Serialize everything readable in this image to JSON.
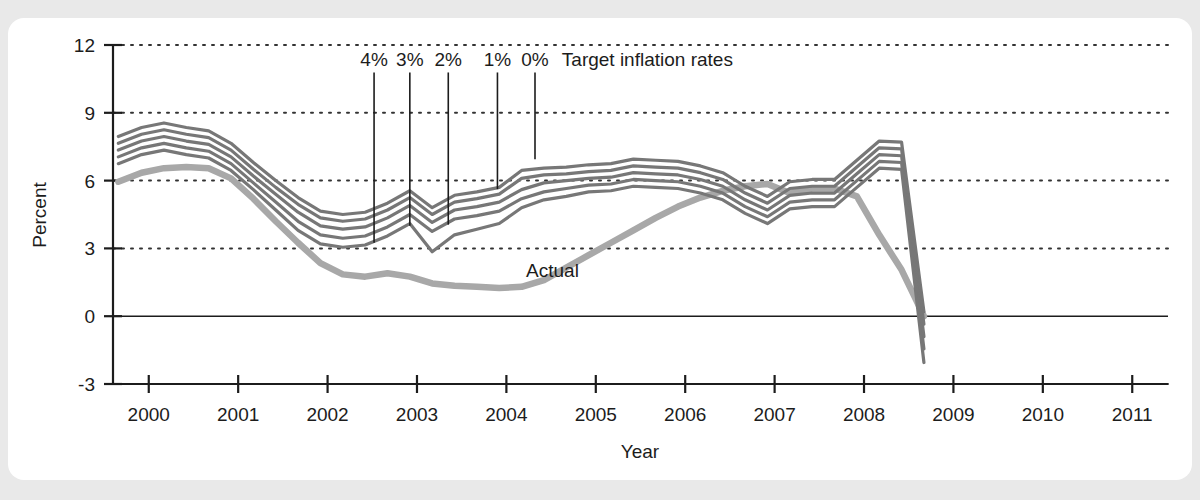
{
  "chart_data": {
    "type": "line",
    "title": "",
    "xlabel": "Year",
    "ylabel": "Percent",
    "xlim": [
      1999.6,
      2011.4
    ],
    "ylim": [
      -3,
      12
    ],
    "yticks": [
      "12",
      "9",
      "6",
      "3",
      "0",
      "-3"
    ],
    "ytick_values": [
      12,
      9,
      6,
      3,
      0,
      -3
    ],
    "xticks": [
      "2000",
      "2001",
      "2002",
      "2003",
      "2004",
      "2005",
      "2006",
      "2007",
      "2008",
      "2009",
      "2010",
      "2011"
    ],
    "xtick_values": [
      2000,
      2001,
      2002,
      2003,
      2004,
      2005,
      2006,
      2007,
      2008,
      2009,
      2010,
      2011
    ],
    "grid": "horizontal-dotted",
    "legend_position": "inline-annotations",
    "annotations": [
      {
        "text": "Target inflation rates",
        "x": 2004.62,
        "y": 11.05
      },
      {
        "text": "Actual",
        "x": 2004.22,
        "y": 1.75
      }
    ],
    "pointer_labels": [
      {
        "label": "4%",
        "x": 2002.52,
        "y_top": 11.05,
        "y_end": 3.25
      },
      {
        "label": "3%",
        "x": 2002.92,
        "y_top": 11.05,
        "y_end": 4.0
      },
      {
        "label": "2%",
        "x": 2003.35,
        "y_top": 11.05,
        "y_end": 4.05
      },
      {
        "label": "1%",
        "x": 2003.9,
        "y_top": 11.05,
        "y_end": 5.62
      },
      {
        "label": "0%",
        "x": 2004.32,
        "y_top": 11.05,
        "y_end": 6.95
      }
    ],
    "x": [
      1999.66,
      1999.92,
      2000.17,
      2000.42,
      2000.67,
      2000.92,
      2001.17,
      2001.42,
      2001.67,
      2001.92,
      2002.17,
      2002.42,
      2002.67,
      2002.92,
      2003.17,
      2003.42,
      2003.67,
      2003.92,
      2004.17,
      2004.42,
      2004.67,
      2004.92,
      2005.17,
      2005.42,
      2005.67,
      2005.92,
      2006.17,
      2006.42,
      2006.67,
      2006.92,
      2007.17,
      2007.42,
      2007.67,
      2007.92,
      2008.17,
      2008.42,
      2008.67
    ],
    "series": [
      {
        "name": "Target 0%",
        "role": "forecast",
        "color": "#777777",
        "values": [
          7.95,
          8.35,
          8.55,
          8.35,
          8.2,
          7.65,
          6.8,
          6.0,
          5.25,
          4.65,
          4.5,
          4.6,
          5.0,
          5.55,
          4.8,
          5.35,
          5.5,
          5.7,
          6.45,
          6.55,
          6.6,
          6.7,
          6.75,
          6.95,
          6.9,
          6.85,
          6.65,
          6.35,
          5.75,
          5.3,
          5.95,
          6.05,
          6.05,
          6.9,
          7.75,
          7.7,
          0.2
        ]
      },
      {
        "name": "Target 1%",
        "role": "forecast",
        "color": "#777777",
        "values": [
          7.65,
          8.05,
          8.25,
          8.05,
          7.9,
          7.35,
          6.5,
          5.7,
          4.95,
          4.35,
          4.2,
          4.3,
          4.7,
          5.25,
          4.5,
          5.05,
          5.2,
          5.4,
          6.1,
          6.25,
          6.3,
          6.4,
          6.45,
          6.65,
          6.6,
          6.55,
          6.35,
          6.05,
          5.45,
          5.0,
          5.65,
          5.75,
          5.75,
          6.6,
          7.45,
          7.4,
          -0.35
        ]
      },
      {
        "name": "Target 2%",
        "role": "forecast",
        "color": "#777777",
        "values": [
          7.35,
          7.75,
          7.95,
          7.75,
          7.6,
          7.05,
          6.2,
          5.4,
          4.6,
          4.0,
          3.85,
          3.95,
          4.35,
          4.9,
          4.15,
          4.7,
          4.85,
          5.05,
          5.6,
          5.9,
          6.0,
          6.1,
          6.15,
          6.35,
          6.3,
          6.25,
          6.05,
          5.75,
          5.15,
          4.7,
          5.35,
          5.45,
          5.45,
          6.3,
          7.15,
          7.1,
          -0.9
        ]
      },
      {
        "name": "Target 3%",
        "role": "forecast",
        "color": "#777777",
        "values": [
          7.05,
          7.45,
          7.65,
          7.45,
          7.3,
          6.75,
          5.9,
          5.05,
          4.2,
          3.6,
          3.45,
          3.55,
          3.95,
          4.5,
          3.75,
          4.3,
          4.45,
          4.65,
          5.2,
          5.5,
          5.65,
          5.8,
          5.85,
          6.05,
          6.0,
          5.95,
          5.75,
          5.45,
          4.85,
          4.4,
          5.05,
          5.15,
          5.15,
          6.0,
          6.85,
          6.8,
          -1.45
        ]
      },
      {
        "name": "Target 4%",
        "role": "forecast",
        "color": "#777777",
        "values": [
          6.75,
          7.15,
          7.35,
          7.15,
          7.0,
          6.45,
          5.6,
          4.7,
          3.8,
          3.2,
          3.05,
          3.15,
          3.55,
          4.1,
          2.85,
          3.6,
          3.85,
          4.1,
          4.8,
          5.15,
          5.3,
          5.5,
          5.55,
          5.75,
          5.7,
          5.65,
          5.45,
          5.15,
          4.55,
          4.1,
          4.75,
          4.85,
          4.85,
          5.7,
          6.55,
          6.5,
          -2.05
        ]
      }
    ],
    "actual_series": {
      "name": "Actual",
      "role": "actual",
      "color": "#a8a8a8",
      "x": [
        1999.66,
        1999.92,
        2000.17,
        2000.42,
        2000.67,
        2000.92,
        2001.17,
        2001.42,
        2001.67,
        2001.92,
        2002.17,
        2002.42,
        2002.67,
        2002.92,
        2003.17,
        2003.42,
        2003.67,
        2003.92,
        2004.17,
        2004.42,
        2004.67,
        2004.92,
        2005.17,
        2005.42,
        2005.67,
        2005.92,
        2006.17,
        2006.42,
        2006.67,
        2006.92,
        2007.17,
        2007.42,
        2007.67,
        2007.92,
        2008.17,
        2008.42,
        2008.67
      ],
      "values": [
        5.95,
        6.35,
        6.55,
        6.6,
        6.55,
        6.1,
        5.2,
        4.2,
        3.25,
        2.35,
        1.85,
        1.75,
        1.9,
        1.75,
        1.45,
        1.35,
        1.3,
        1.25,
        1.3,
        1.6,
        2.15,
        2.7,
        3.25,
        3.8,
        4.35,
        4.85,
        5.25,
        5.55,
        5.75,
        5.85,
        5.45,
        5.65,
        5.65,
        5.3,
        3.6,
        2.05,
        0.0
      ]
    }
  },
  "style": {
    "panel_background": "#ffffff",
    "page_background": "#e9e9e9",
    "axis_color": "#1c1c1c",
    "grid_color": "#333333",
    "forecast_color": "#777777",
    "actual_color": "#a8a8a8",
    "text_color": "#1c1c1c"
  }
}
